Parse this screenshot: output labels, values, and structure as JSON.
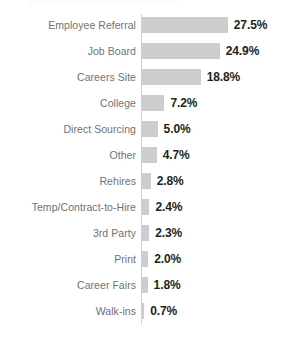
{
  "title_fragment": "",
  "colors": {
    "background": "#ffffff",
    "bar_fill": "#cdcdcd",
    "axis_line": "#d2d2d2",
    "category_label": "#6f7276",
    "value_label": "#231f20"
  },
  "chart_data": {
    "type": "bar",
    "orientation": "horizontal",
    "title": "",
    "xlabel": "",
    "ylabel": "",
    "grid": false,
    "legend": false,
    "xlim": [
      0,
      27.5
    ],
    "value_suffix": "%",
    "categories": [
      "Employee Referral",
      "Job Board",
      "Careers Site",
      "College",
      "Direct Sourcing",
      "Other",
      "Rehires",
      "Temp/Contract-to-Hire",
      "3rd Party",
      "Print",
      "Career Fairs",
      "Walk-ins"
    ],
    "values": [
      27.5,
      24.9,
      18.8,
      7.2,
      5.0,
      4.7,
      2.8,
      2.4,
      2.3,
      2.0,
      1.8,
      0.7
    ],
    "value_labels": [
      "27.5%",
      "24.9%",
      "18.8%",
      "7.2%",
      "5.0%",
      "4.7%",
      "2.8%",
      "2.4%",
      "2.3%",
      "2.0%",
      "1.8%",
      "0.7%"
    ]
  }
}
